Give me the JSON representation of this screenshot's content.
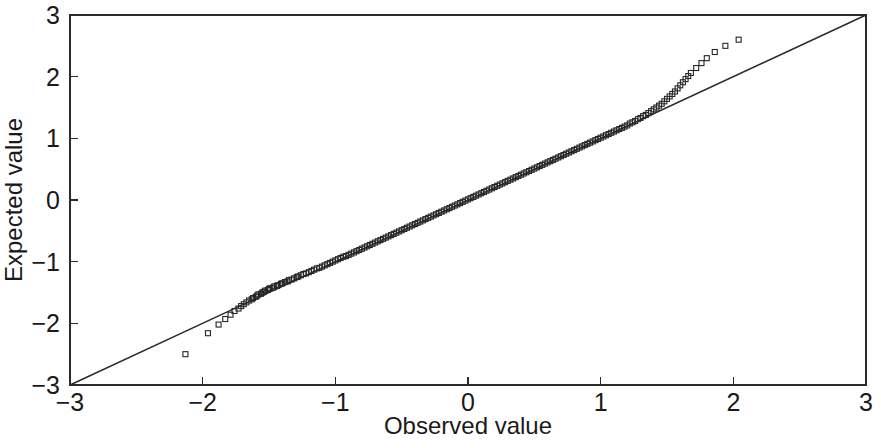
{
  "chart_data": {
    "type": "scatter",
    "title": "",
    "subtitle": "",
    "xlabel": "Observed value",
    "ylabel": "Expected value",
    "xlim": [
      -3,
      3
    ],
    "ylim": [
      -3,
      3
    ],
    "grid": false,
    "legend": null,
    "legend_position": "none",
    "x_ticks": [
      -3,
      -2,
      -1,
      0,
      1,
      2,
      3
    ],
    "y_ticks": [
      -3,
      -2,
      -1,
      0,
      1,
      2,
      3
    ],
    "x_tick_labels": [
      "-3",
      "-2",
      "-1",
      "0",
      "1",
      "2",
      "3"
    ],
    "y_tick_labels": [
      "-3",
      "-2",
      "-1",
      "0",
      "1",
      "2",
      "3"
    ],
    "marker": "open-square",
    "marker_size": 5,
    "point_color": "#262626",
    "line_color": "#2b2b2b",
    "background_color": "#ffffff",
    "reference_line": {
      "label": "identity line y = x",
      "x0": -3,
      "y0": -3,
      "x1": 3,
      "y1": 3
    },
    "series": [
      {
        "name": "normal Q-Q points",
        "x": [
          -2.13,
          -1.96,
          -1.88,
          -1.83,
          -1.79,
          -1.76,
          -1.73,
          -1.71,
          -1.69,
          -1.67,
          -1.65,
          -1.63,
          -1.62,
          -1.6,
          -1.59,
          -1.58,
          -1.56,
          -1.55,
          -1.54,
          -1.53,
          -1.51,
          -1.5,
          -1.49,
          -1.47,
          -1.46,
          -1.44,
          -1.43,
          -1.41,
          -1.4,
          -1.38,
          -1.36,
          -1.35,
          -1.33,
          -1.31,
          -1.29,
          -1.28,
          -1.26,
          -1.24,
          -1.22,
          -1.2,
          -1.18,
          -1.16,
          -1.14,
          -1.12,
          -1.1,
          -1.08,
          -1.06,
          -1.04,
          -1.02,
          -1.0,
          -0.98,
          -0.96,
          -0.94,
          -0.92,
          -0.9,
          -0.88,
          -0.86,
          -0.84,
          -0.82,
          -0.8,
          -0.78,
          -0.76,
          -0.74,
          -0.72,
          -0.7,
          -0.68,
          -0.66,
          -0.64,
          -0.62,
          -0.6,
          -0.58,
          -0.56,
          -0.54,
          -0.52,
          -0.5,
          -0.48,
          -0.46,
          -0.44,
          -0.42,
          -0.4,
          -0.38,
          -0.36,
          -0.34,
          -0.32,
          -0.3,
          -0.28,
          -0.26,
          -0.24,
          -0.22,
          -0.2,
          -0.18,
          -0.16,
          -0.14,
          -0.12,
          -0.1,
          -0.08,
          -0.06,
          -0.04,
          -0.02,
          0.0,
          0.02,
          0.04,
          0.06,
          0.08,
          0.1,
          0.12,
          0.14,
          0.16,
          0.18,
          0.2,
          0.22,
          0.24,
          0.26,
          0.28,
          0.3,
          0.32,
          0.34,
          0.36,
          0.38,
          0.4,
          0.42,
          0.44,
          0.46,
          0.48,
          0.5,
          0.52,
          0.54,
          0.56,
          0.58,
          0.6,
          0.62,
          0.64,
          0.66,
          0.68,
          0.7,
          0.72,
          0.74,
          0.76,
          0.78,
          0.8,
          0.82,
          0.84,
          0.86,
          0.88,
          0.9,
          0.92,
          0.94,
          0.96,
          0.98,
          1.0,
          1.02,
          1.04,
          1.06,
          1.08,
          1.1,
          1.12,
          1.14,
          1.16,
          1.18,
          1.2,
          1.22,
          1.24,
          1.26,
          1.28,
          1.3,
          1.32,
          1.34,
          1.36,
          1.38,
          1.4,
          1.42,
          1.44,
          1.46,
          1.48,
          1.5,
          1.52,
          1.54,
          1.56,
          1.58,
          1.6,
          1.62,
          1.64,
          1.66,
          1.68,
          1.72,
          1.76,
          1.8,
          1.86,
          1.94,
          2.04
        ],
        "y": [
          -2.5,
          -2.16,
          -2.02,
          -1.93,
          -1.86,
          -1.8,
          -1.76,
          -1.72,
          -1.69,
          -1.66,
          -1.63,
          -1.61,
          -1.59,
          -1.57,
          -1.55,
          -1.53,
          -1.52,
          -1.5,
          -1.49,
          -1.47,
          -1.46,
          -1.44,
          -1.43,
          -1.42,
          -1.4,
          -1.39,
          -1.38,
          -1.36,
          -1.35,
          -1.33,
          -1.32,
          -1.3,
          -1.29,
          -1.27,
          -1.25,
          -1.24,
          -1.22,
          -1.2,
          -1.19,
          -1.17,
          -1.15,
          -1.13,
          -1.11,
          -1.1,
          -1.08,
          -1.06,
          -1.04,
          -1.02,
          -1.0,
          -0.98,
          -0.96,
          -0.94,
          -0.92,
          -0.91,
          -0.89,
          -0.87,
          -0.85,
          -0.83,
          -0.81,
          -0.79,
          -0.77,
          -0.75,
          -0.73,
          -0.71,
          -0.69,
          -0.67,
          -0.65,
          -0.63,
          -0.61,
          -0.59,
          -0.57,
          -0.55,
          -0.53,
          -0.51,
          -0.49,
          -0.47,
          -0.45,
          -0.43,
          -0.41,
          -0.39,
          -0.37,
          -0.35,
          -0.33,
          -0.31,
          -0.29,
          -0.27,
          -0.25,
          -0.23,
          -0.21,
          -0.19,
          -0.17,
          -0.15,
          -0.13,
          -0.11,
          -0.09,
          -0.07,
          -0.05,
          -0.03,
          -0.01,
          0.01,
          0.03,
          0.05,
          0.07,
          0.09,
          0.11,
          0.13,
          0.15,
          0.17,
          0.19,
          0.21,
          0.23,
          0.25,
          0.27,
          0.29,
          0.31,
          0.33,
          0.35,
          0.37,
          0.39,
          0.41,
          0.43,
          0.45,
          0.47,
          0.49,
          0.51,
          0.53,
          0.55,
          0.57,
          0.59,
          0.61,
          0.63,
          0.65,
          0.67,
          0.69,
          0.71,
          0.73,
          0.75,
          0.77,
          0.79,
          0.81,
          0.83,
          0.85,
          0.87,
          0.89,
          0.91,
          0.93,
          0.95,
          0.97,
          0.99,
          1.01,
          1.03,
          1.05,
          1.07,
          1.09,
          1.11,
          1.13,
          1.15,
          1.17,
          1.19,
          1.21,
          1.24,
          1.26,
          1.28,
          1.31,
          1.33,
          1.36,
          1.38,
          1.41,
          1.44,
          1.47,
          1.5,
          1.53,
          1.56,
          1.6,
          1.64,
          1.68,
          1.72,
          1.76,
          1.81,
          1.86,
          1.91,
          1.96,
          2.01,
          2.06,
          2.14,
          2.22,
          2.3,
          2.4,
          2.5,
          2.6
        ]
      }
    ]
  },
  "layout": {
    "plot_left": 70,
    "plot_right": 866,
    "plot_top": 15,
    "plot_bottom": 385,
    "tick_length": 8,
    "x_axis_label_y": 434,
    "y_axis_label_x": 22
  }
}
